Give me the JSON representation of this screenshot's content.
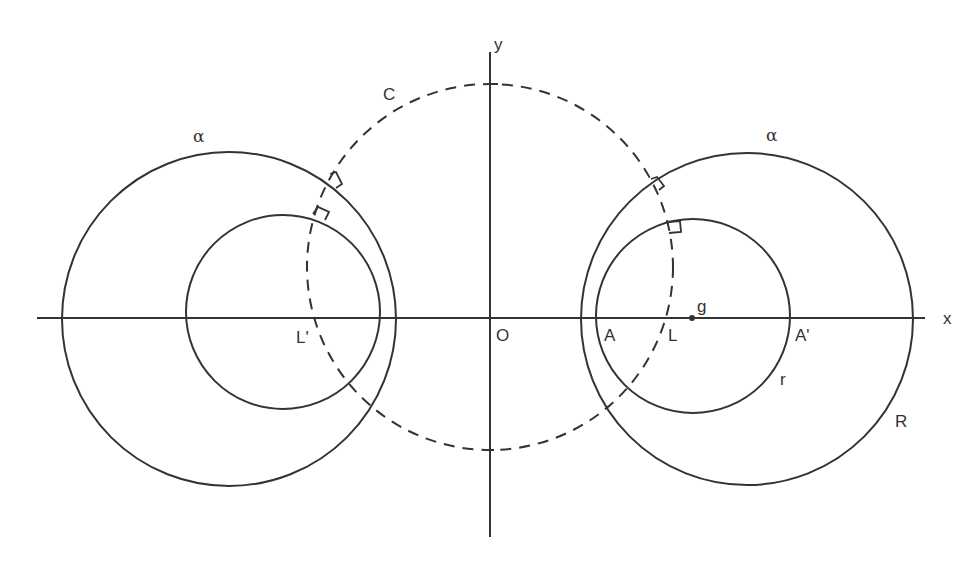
{
  "diagram": {
    "type": "geometric construction",
    "stroke_color": "#333333",
    "background": "#ffffff",
    "axes": {
      "x_label": "x",
      "y_label": "y",
      "origin_label": "O"
    },
    "dashed_circle": {
      "label": "C"
    },
    "left_pair": {
      "outer_label": "α",
      "center_label": "L'"
    },
    "right_pair": {
      "outer_label": "α",
      "outer_radius_label": "R",
      "inner_radius_label": "r",
      "center_label": "L",
      "centroid_label": "g",
      "inner_left_point_label": "A",
      "inner_right_point_label": "A'"
    }
  }
}
